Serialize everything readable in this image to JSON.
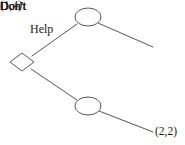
{
  "figure": {
    "kind": "extensive-form-game-tree",
    "background_color": "#ffffff",
    "line_color": "#555555",
    "text_color": "#1a1a1a"
  },
  "nodes": [
    {
      "id": "decision-node",
      "shape": "diamond",
      "role": "initial-decision-node",
      "cx": 22,
      "cy": 62,
      "rx": 12,
      "ry": 9
    },
    {
      "id": "chance-node-upper",
      "shape": "ellipse",
      "role": "second-stage-node-after-help",
      "cx": 88,
      "cy": 17,
      "rx": 13,
      "ry": 9
    },
    {
      "id": "chance-node-lower",
      "shape": "ellipse",
      "role": "second-stage-node-after-don't",
      "cx": 88,
      "cy": 106,
      "rx": 13,
      "ry": 9
    }
  ],
  "branches": [
    {
      "id": "branch-help",
      "label": "Help",
      "from": "decision-node",
      "to": "chance-node-upper",
      "x1": 32,
      "y1": 56,
      "x2": 77,
      "y2": 24
    },
    {
      "id": "branch-don't-upper",
      "label": "Don't",
      "from": "chance-node-upper",
      "to": "payoff-upper",
      "x1": 98,
      "y1": 23,
      "x2": 153,
      "y2": 47
    },
    {
      "id": "branch-don't-lower",
      "label": "Don't",
      "from": "decision-node",
      "to": "chance-node-lower",
      "x1": 31,
      "y1": 69,
      "x2": 77,
      "y2": 100
    },
    {
      "id": "branch-don't-bottom",
      "label": "Don't",
      "from": "chance-node-lower",
      "to": "payoff-lower",
      "x1": 99,
      "y1": 111,
      "x2": 153,
      "y2": 132
    }
  ],
  "labels": {
    "help": "Help",
    "dont_upper": "Don't",
    "dont_lower": "Don't",
    "dont_bottom": "Don't"
  },
  "payoffs": {
    "upper": "(1,4)",
    "lower": "(2,2)"
  }
}
